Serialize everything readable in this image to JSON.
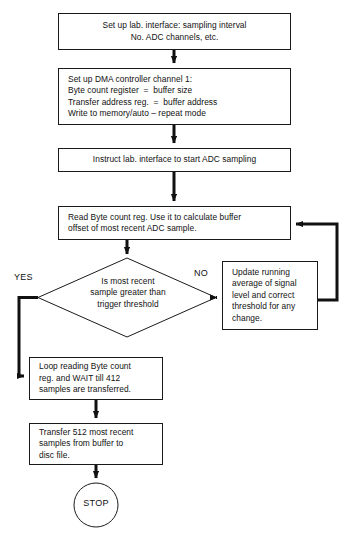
{
  "diagram": {
    "type": "flowchart",
    "stroke_color": "#1a1a1a",
    "text_color": "#111111",
    "background_color": "#ffffff"
  },
  "nodes": {
    "setup_lab": {
      "shape": "process",
      "lines": [
        "Set up lab. interface: sampling interval",
        "No. ADC channels, etc."
      ]
    },
    "setup_dma": {
      "shape": "process",
      "lines": [
        "Set up DMA controller channel 1:",
        "Byte count register  =  buffer size",
        "Transfer address reg.  =  buffer address",
        "Write to memory/auto – repeat mode"
      ]
    },
    "instruct": {
      "shape": "process",
      "lines": [
        "Instruct lab. interface to start ADC sampling"
      ]
    },
    "read_byte_count": {
      "shape": "process",
      "lines": [
        "Read Byte count reg. Use it to calculate buffer",
        "offset of most recent ADC sample."
      ]
    },
    "decision": {
      "shape": "decision",
      "lines": [
        "Is most recent",
        "sample greater than",
        "trigger threshold"
      ]
    },
    "update_average": {
      "shape": "process",
      "lines": [
        "Update running",
        "average of signal",
        "level and correct",
        "threshold for any",
        "change."
      ]
    },
    "loop_wait": {
      "shape": "process",
      "lines": [
        "Loop reading Byte count",
        "reg. and WAIT till 412",
        "samples are transferred."
      ]
    },
    "transfer": {
      "shape": "process",
      "lines": [
        "Transfer 512 most recent",
        "samples from buffer to",
        "disc file."
      ]
    },
    "stop": {
      "shape": "terminator",
      "label": "STOP"
    }
  },
  "edge_labels": {
    "yes": "YES",
    "no": "NO"
  }
}
